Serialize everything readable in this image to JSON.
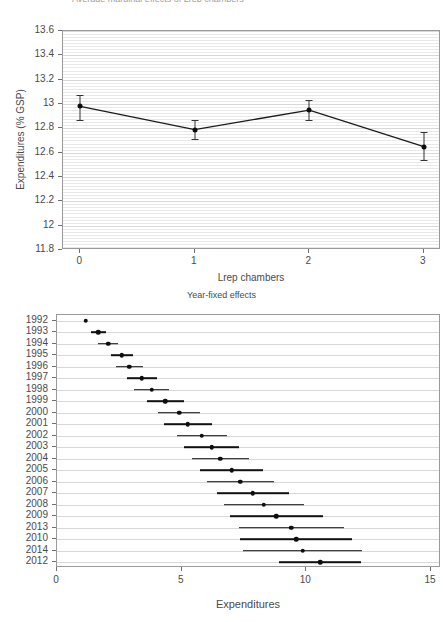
{
  "page": {
    "clipped_top_text": "Average marginal effects of Lrep chambers",
    "width": 443,
    "height": 622
  },
  "top_panel": {
    "name": "marginal-effects-by-chambers",
    "ylabel": "Expenditures (% GSP)",
    "xlabel": "Lrep chambers",
    "y_ticks": [
      "11.8",
      "12",
      "12.2",
      "12.4",
      "12.6",
      "12.8",
      "13",
      "13.2",
      "13.4",
      "13.6"
    ],
    "x_ticks": [
      "0",
      "1",
      "2",
      "3"
    ]
  },
  "bottom_panel": {
    "name": "year-fixed-effects",
    "title": "Year-fixed effects",
    "xlabel": "Expenditures",
    "x_ticks": [
      "0",
      "5",
      "10",
      "15"
    ]
  },
  "chart_data": [
    {
      "type": "line",
      "name": "top-panel",
      "title": "",
      "xlabel": "Lrep chambers",
      "ylabel": "Expenditures (% GSP)",
      "x": [
        0,
        1,
        2,
        3
      ],
      "categories": [
        "0",
        "1",
        "2",
        "3"
      ],
      "values": [
        12.98,
        12.79,
        12.95,
        12.65
      ],
      "ci_low": [
        12.87,
        12.71,
        12.87,
        12.54
      ],
      "ci_high": [
        13.07,
        12.87,
        13.03,
        12.77
      ],
      "xlim": [
        -0.15,
        3.15
      ],
      "ylim": [
        11.8,
        13.6
      ],
      "ytick_step": 0.2,
      "grid": true,
      "legend": "none",
      "markers": "filled-circle-with-error-bars"
    },
    {
      "type": "scatter",
      "name": "bottom-panel",
      "title": "Year-fixed effects",
      "xlabel": "Expenditures",
      "ylabel": "",
      "xlim": [
        0,
        15.4
      ],
      "grid": true,
      "legend": "none",
      "orientation": "horizontal",
      "categories": [
        "1992",
        "1993",
        "1994",
        "1995",
        "1996",
        "1997",
        "1998",
        "1999",
        "2000",
        "2001",
        "2002",
        "2003",
        "2004",
        "2005",
        "2006",
        "2007",
        "2008",
        "2009",
        "2013",
        "2010",
        "2014",
        "2012"
      ],
      "values": [
        1.15,
        1.65,
        2.05,
        2.6,
        2.9,
        3.4,
        3.8,
        4.35,
        4.9,
        5.25,
        5.8,
        6.2,
        6.55,
        7.0,
        7.35,
        7.85,
        8.3,
        8.8,
        9.4,
        9.6,
        9.85,
        10.55
      ],
      "ci_low": [
        1.1,
        1.35,
        1.65,
        2.15,
        2.35,
        2.8,
        3.1,
        3.6,
        4.05,
        4.3,
        4.8,
        5.1,
        5.4,
        5.75,
        6.0,
        6.4,
        6.7,
        6.95,
        7.3,
        7.35,
        7.45,
        8.9
      ],
      "ci_high": [
        1.2,
        1.95,
        2.45,
        3.05,
        3.45,
        4.0,
        4.5,
        5.1,
        5.75,
        6.2,
        6.8,
        7.3,
        7.7,
        8.25,
        8.7,
        9.3,
        9.9,
        10.65,
        11.5,
        11.85,
        12.25,
        12.2
      ]
    }
  ]
}
